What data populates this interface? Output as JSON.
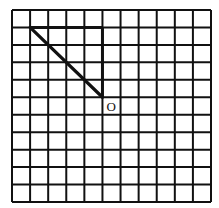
{
  "grid": {
    "columns": 11,
    "rows": 11,
    "line_color": "#111111",
    "background": "#ffffff"
  },
  "figure": {
    "segment": {
      "from": [
        1,
        1
      ],
      "to": [
        5,
        5
      ],
      "description": "diagonal segment ending at point O"
    },
    "emphasized_edges": [
      {
        "from": [
          1,
          1
        ],
        "to": [
          5,
          1
        ]
      },
      {
        "from": [
          5,
          1
        ],
        "to": [
          5,
          5
        ]
      }
    ],
    "point_label": "O",
    "point": [
      5,
      5
    ]
  }
}
